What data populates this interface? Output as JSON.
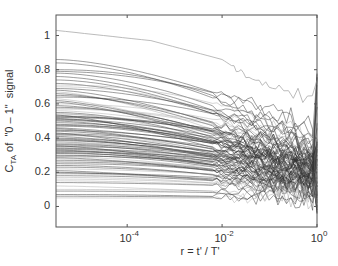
{
  "chart_data": {
    "type": "line",
    "title": "",
    "xlabel": "r = t' / T'",
    "ylabel_main": "C",
    "ylabel_sub": "TA",
    "ylabel_rest": " of  \"0 – 1\"  signal",
    "xscale": "log",
    "xlim_log10": [
      -5.5,
      0
    ],
    "ylim": [
      -0.12,
      1.12
    ],
    "grid": false,
    "legend": null,
    "x_ticks": [
      {
        "base": "10",
        "exp": "-4",
        "log10": -4
      },
      {
        "base": "10",
        "exp": "-2",
        "log10": -2
      },
      {
        "base": "10",
        "exp": "0",
        "log10": 0
      }
    ],
    "y_ticks": [
      {
        "label": "0",
        "value": 0
      },
      {
        "label": "0.2",
        "value": 0.2
      },
      {
        "label": "0.4",
        "value": 0.4
      },
      {
        "label": "0.6",
        "value": 0.6
      },
      {
        "label": "0.8",
        "value": 0.8
      },
      {
        "label": "1",
        "value": 1
      }
    ],
    "series_description": "~100 decaying correlation curves C_TA(r), one per trace; values at left edge (r≈10^-5.5) listed; curves decrease smoothly toward r≈10^-2, then become noisy and converge near 0–0.3 at r=1 with spikes at the right edge",
    "highlight_series": {
      "name": "top gray curve",
      "start": 1.03,
      "points": [
        [
          -5.5,
          1.03
        ],
        [
          -3.5,
          0.97
        ],
        [
          -2,
          0.86
        ],
        [
          -1.5,
          0.77
        ],
        [
          -0.8,
          0.68
        ]
      ],
      "color": "#aaaaaa"
    },
    "series_start_values": [
      0.86,
      0.84,
      0.8,
      0.79,
      0.78,
      0.76,
      0.74,
      0.72,
      0.71,
      0.7,
      0.69,
      0.68,
      0.67,
      0.66,
      0.65,
      0.64,
      0.63,
      0.62,
      0.61,
      0.6,
      0.59,
      0.58,
      0.575,
      0.57,
      0.56,
      0.55,
      0.545,
      0.54,
      0.535,
      0.53,
      0.525,
      0.52,
      0.515,
      0.51,
      0.505,
      0.5,
      0.49,
      0.48,
      0.475,
      0.47,
      0.46,
      0.455,
      0.45,
      0.445,
      0.44,
      0.43,
      0.425,
      0.42,
      0.415,
      0.41,
      0.4,
      0.395,
      0.39,
      0.385,
      0.38,
      0.375,
      0.37,
      0.365,
      0.36,
      0.355,
      0.35,
      0.345,
      0.34,
      0.335,
      0.33,
      0.325,
      0.32,
      0.315,
      0.31,
      0.3,
      0.295,
      0.29,
      0.285,
      0.28,
      0.27,
      0.26,
      0.25,
      0.24,
      0.23,
      0.22,
      0.21,
      0.2,
      0.195,
      0.19,
      0.18,
      0.17,
      0.16,
      0.15,
      0.14,
      0.12,
      0.1,
      0.09,
      0.07,
      0.06,
      0.05
    ],
    "end_values_at_r1_range": [
      -0.05,
      1.0
    ],
    "line_color": "#333333",
    "line_color_light": "#999999"
  },
  "plot": {
    "box": {
      "left": 56,
      "top": 15,
      "right": 317,
      "bottom": 227
    },
    "axis_color": "#555555"
  }
}
